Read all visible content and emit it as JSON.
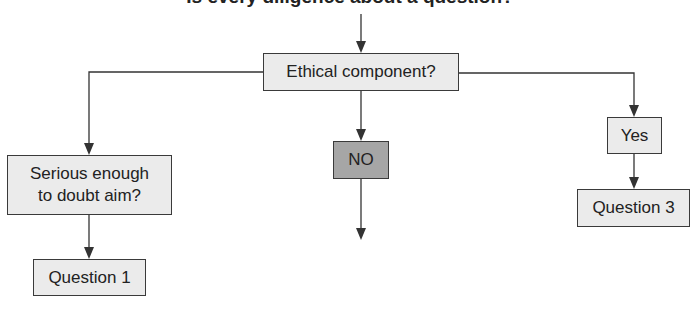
{
  "title": "Is every diligence about a question?",
  "nodes": {
    "root": {
      "label": "Ethical component?"
    },
    "left": {
      "label_line1": "Serious enough",
      "label_line2": "to doubt aim?"
    },
    "left_result": {
      "label": "Question 1"
    },
    "middle": {
      "label": "NO"
    },
    "right": {
      "label": "Yes"
    },
    "right_result": {
      "label": "Question 3"
    }
  },
  "colors": {
    "box_fill": "#ebebeb",
    "highlight_fill": "#a6a6a6",
    "border": "#3a3a3a",
    "line": "#333333"
  }
}
